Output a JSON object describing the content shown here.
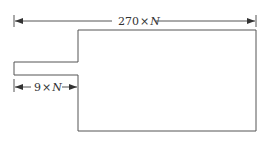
{
  "diagram": {
    "type": "dimensioned-outline",
    "colors": {
      "stroke": "#555555",
      "text": "#333333",
      "background": "#ffffff"
    },
    "dimensions": {
      "overall_width": {
        "number": "270",
        "times": "×",
        "variable": "N"
      },
      "tab_length": {
        "number": "9",
        "times": "×",
        "variable": "N"
      }
    }
  }
}
